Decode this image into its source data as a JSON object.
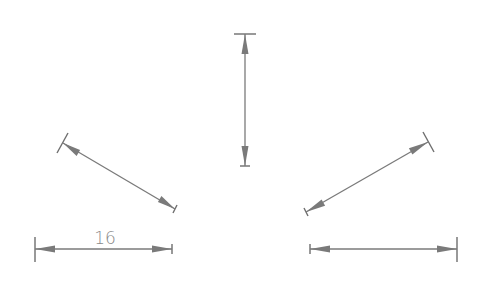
{
  "diagram": {
    "title": "",
    "colors": {
      "line": "#7a7a7a",
      "text": "#8a8a8a",
      "background": "#ffffff"
    },
    "dimensions": [
      {
        "id": "bottom-left-horizontal",
        "label": "16",
        "from": [
          35,
          249
        ],
        "to": [
          172,
          249
        ]
      },
      {
        "id": "left-diagonal",
        "label": "",
        "from": [
          63,
          143
        ],
        "to": [
          175,
          209
        ]
      },
      {
        "id": "top-vertical",
        "label": "",
        "from": [
          245,
          34
        ],
        "to": [
          245,
          166
        ]
      },
      {
        "id": "right-diagonal",
        "label": "",
        "from": [
          306,
          212
        ],
        "to": [
          428,
          142
        ]
      },
      {
        "id": "bottom-right-horizontal",
        "label": "",
        "from": [
          310,
          249
        ],
        "to": [
          457,
          249
        ]
      }
    ]
  }
}
